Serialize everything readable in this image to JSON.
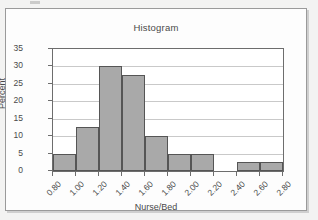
{
  "chart_data": {
    "type": "bar",
    "title": "Histogram",
    "xlabel": "Nurse/Bed",
    "ylabel": "Percent",
    "grid": true,
    "legend": false,
    "bin_edges": [
      0.8,
      1.0,
      1.2,
      1.4,
      1.6,
      1.8,
      2.0,
      2.2,
      2.4,
      2.6,
      2.8
    ],
    "categories": [
      "0.80-1.00",
      "1.00-1.20",
      "1.20-1.40",
      "1.40-1.60",
      "1.60-1.80",
      "1.80-2.00",
      "2.00-2.20",
      "2.20-2.40",
      "2.40-2.60",
      "2.60-2.80"
    ],
    "values": [
      5,
      12.5,
      30,
      27.5,
      10,
      5,
      5,
      0,
      2.5,
      2.5
    ],
    "xtick_labels": [
      "0.80",
      "1.00",
      "1.20",
      "1.40",
      "1.60",
      "1.80",
      "2.00",
      "2.20",
      "2.40",
      "2.60",
      "2.80"
    ],
    "ytick_labels": [
      "0",
      "5",
      "10",
      "15",
      "20",
      "25",
      "30",
      "35"
    ],
    "ytick_values": [
      0,
      5,
      10,
      15,
      20,
      25,
      30,
      35
    ],
    "ylim": [
      0,
      35
    ],
    "xlim": [
      0.8,
      2.8
    ],
    "bar_fill_color": "#a9a9a9",
    "bar_edge_color": "#555555",
    "grid_color": "#c9c9c9",
    "axis_color": "#6d6d6d",
    "text_color": "#4a4a4a",
    "plot_background": "#ffffff",
    "page_background": "#f3f3f2"
  }
}
